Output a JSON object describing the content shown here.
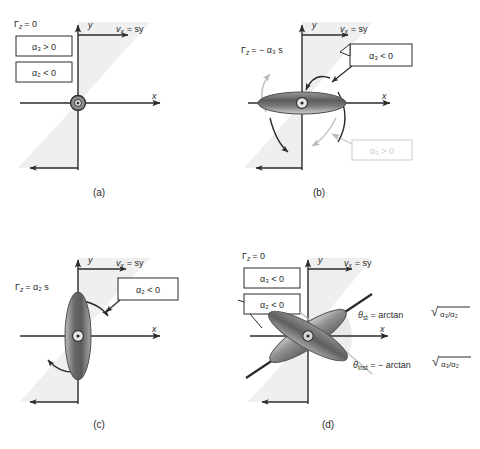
{
  "figure": {
    "type": "scientific-diagram",
    "background": "#ffffff",
    "ink_color": "#2b2b2b",
    "shear_wedge_color": "#eeeeee",
    "ghost_color": "#c9c9c9"
  },
  "common": {
    "axis_x_label": "x",
    "axis_y_label": "y",
    "velocity_label_sub": "v",
    "velocity_label_subscript": "x",
    "velocity_label_rest": "= sy",
    "velocity_label_full": "v x = sy",
    "origin_icon": "out-of-plane-vector-icon"
  },
  "panels": [
    {
      "id": "a",
      "caption": "(a)",
      "torque_label": {
        "symbol": "Γ",
        "subscript": "z",
        "rest": "= 0"
      },
      "boxes": [
        {
          "text": "α₃ > 0",
          "style": "dark"
        },
        {
          "text": "α₂ < 0",
          "style": "dark"
        }
      ],
      "particle": "point-origin",
      "ghost_box": null,
      "angle_labels": []
    },
    {
      "id": "b",
      "caption": "(b)",
      "torque_label": {
        "symbol": "Γ",
        "subscript": "z",
        "rest": "= − α₃ s"
      },
      "boxes": [
        {
          "text": "α₃ < 0",
          "style": "dark"
        }
      ],
      "ghost_box": {
        "text": "α₃ > 0",
        "style": "ghost"
      },
      "particle": "horizontal-ellipse",
      "angle_labels": []
    },
    {
      "id": "c",
      "caption": "(c)",
      "torque_label": {
        "symbol": "Γ",
        "subscript": "z",
        "rest": "= α₂ s"
      },
      "boxes": [
        {
          "text": "α₂ < 0",
          "style": "dark"
        }
      ],
      "ghost_box": null,
      "particle": "vertical-ellipse",
      "angle_labels": []
    },
    {
      "id": "d",
      "caption": "(d)",
      "torque_label": {
        "symbol": "Γ",
        "subscript": "z",
        "rest": "= 0"
      },
      "boxes": [
        {
          "text": "α₃ < 0",
          "style": "dark"
        },
        {
          "text": "α₂ < 0",
          "style": "dark"
        }
      ],
      "ghost_box": null,
      "particle": "crossed-ellipses",
      "angle_labels": [
        {
          "name": "theta-stable",
          "symbol": "θ",
          "subscript": "st",
          "expression": "= arctan",
          "radicand": "α₃/α₂",
          "full": "θst = arctan √(α₃/α₂)",
          "style": "dark"
        },
        {
          "name": "theta-instable",
          "symbol": "θ",
          "subscript": "inst",
          "expression": "= − arctan",
          "radicand": "α₃/α₂",
          "full": "θinst = − arctan √(α₃/α₂)",
          "style": "dark"
        }
      ]
    }
  ]
}
